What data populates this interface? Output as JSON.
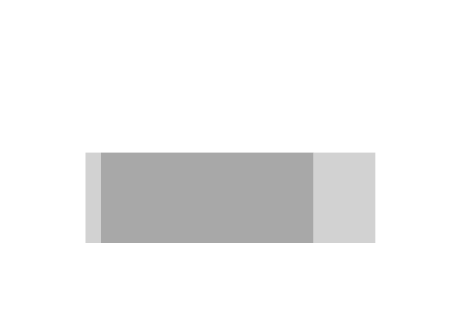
{
  "figure": {
    "background": "#ffffff",
    "curve_color": "#3a3a3a",
    "light_fill": "#d2d2d2",
    "dark_fill": "#a8a8a8",
    "axis_color": "#2b2b2b"
  },
  "chart_data": {
    "type": "line",
    "title": "",
    "xlabel": "c",
    "ylabel": "1/r(c)",
    "ylabel_parts": {
      "numerator": "1",
      "denominator": "r(c)"
    },
    "xlim": [
      0,
      6
    ],
    "ylim": [
      0,
      10
    ],
    "xticks": [
      0,
      1,
      2,
      3,
      4,
      5,
      6
    ],
    "xticklabels": [
      "0",
      "1",
      "2",
      "3",
      "4",
      "5",
      "6"
    ],
    "yticks": [
      0,
      2,
      4,
      6,
      8,
      10
    ],
    "yticklabels": [
      "0",
      "2",
      "4",
      "6",
      "8",
      "10"
    ],
    "yminorticks": [
      1,
      3,
      5,
      7,
      9
    ],
    "grid": false,
    "legend": false,
    "series": [
      {
        "name": "1/r(c)",
        "x": [
          0.195,
          0.21,
          0.23,
          0.25,
          0.27,
          0.3,
          0.33,
          0.36,
          0.4,
          0.44,
          0.48,
          0.52,
          0.55,
          0.6,
          0.65,
          0.72,
          0.8,
          0.9,
          1.0,
          1.15,
          1.3,
          1.45,
          1.6,
          1.8,
          2.0,
          2.2,
          2.45,
          2.7,
          3.0,
          3.3,
          3.6,
          4.0,
          4.4,
          4.8,
          5.0,
          5.4,
          5.7,
          6.0
        ],
        "y": [
          10.0,
          9.5,
          8.85,
          8.25,
          7.7,
          7.0,
          6.42,
          5.96,
          5.48,
          5.12,
          4.8,
          4.48,
          4.22,
          4.02,
          3.95,
          4.02,
          4.22,
          4.48,
          4.7,
          4.95,
          5.08,
          5.16,
          5.2,
          5.21,
          5.15,
          5.02,
          4.82,
          4.62,
          4.38,
          4.2,
          4.08,
          4.0,
          3.8,
          3.62,
          3.55,
          3.38,
          3.24,
          3.1
        ]
      }
    ],
    "markers": [
      {
        "name": "c3",
        "x": 0.3,
        "y": 7.0
      },
      {
        "name": "c2",
        "x": 0.55,
        "y": 4.0
      },
      {
        "name": "c1",
        "x": 4.0,
        "y": 4.0
      },
      {
        "name": "c0",
        "x": 5.0,
        "y": 3.55
      }
    ],
    "regions": [
      {
        "name": "theta3",
        "x0": 0.3,
        "x1": 0.55,
        "y0": 0,
        "y1": 4.0,
        "fill": "light",
        "label": "θ₃ = 1.07",
        "value": 1.07
      },
      {
        "name": "theta2",
        "x0": 0.55,
        "x1": 4.0,
        "y0": 0,
        "y1": 4.0,
        "fill": "dark",
        "label": "θ₂ = 13.9",
        "value": 13.9
      },
      {
        "name": "theta1",
        "x0": 4.0,
        "x1": 5.0,
        "y0": 0,
        "y1": 4.0,
        "fill": "light",
        "label": "θ₁ = 3.95",
        "value": 3.95
      }
    ],
    "annotations": [
      {
        "name": "theta3-label",
        "text": "θ₃ = 1.07",
        "x": 0.46,
        "y": 5.45
      },
      {
        "name": "theta2-label",
        "text": "θ₂ = 13.9",
        "x": 2.2,
        "y": 2.45
      },
      {
        "name": "theta1-label",
        "text": "θ₁ = 3.95",
        "x": 4.52,
        "y": 2.45
      },
      {
        "name": "c3-label",
        "text": "c₃",
        "x": 0.39,
        "y": 0.85
      },
      {
        "name": "c2-label",
        "text": "c₂",
        "x": 0.7,
        "y": 0.85
      },
      {
        "name": "c1-label",
        "text": "c₁",
        "x": 4.15,
        "y": 0.85
      },
      {
        "name": "c0-label",
        "text": "c₀",
        "x": 5.15,
        "y": 0.85
      }
    ]
  },
  "inset": {
    "name": "reactor-network-diagram",
    "streams": [
      {
        "name": "c0",
        "label": "c₀"
      },
      {
        "name": "c1",
        "label": "c₁"
      },
      {
        "name": "c2",
        "label": "c₂"
      },
      {
        "name": "c3",
        "label": "c₃"
      }
    ],
    "units": [
      {
        "name": "pfr-1",
        "type": "tubular-reactor",
        "label": "θ₁"
      },
      {
        "name": "cstr",
        "type": "stirred-tank-reactor",
        "label": "θ₂"
      },
      {
        "name": "pfr-2",
        "type": "tubular-reactor",
        "label": "θ₁"
      }
    ]
  }
}
